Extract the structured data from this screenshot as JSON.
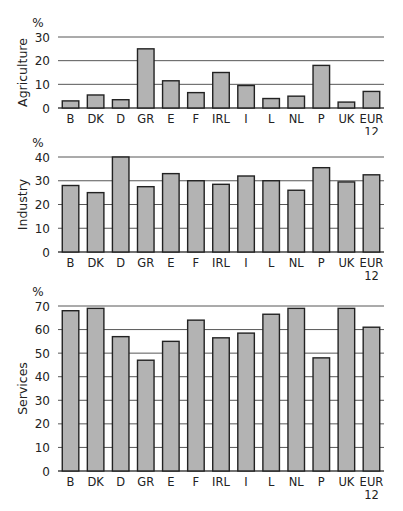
{
  "chart_data": [
    {
      "type": "bar",
      "title": "",
      "ylabel": "Agriculture",
      "unit": "%",
      "xlabel": "",
      "categories": [
        "B",
        "DK",
        "D",
        "GR",
        "E",
        "F",
        "IRL",
        "I",
        "L",
        "NL",
        "P",
        "UK",
        "EUR 12"
      ],
      "values": [
        3,
        5.5,
        3.5,
        25,
        11.5,
        6.5,
        15,
        9.5,
        4,
        5,
        18,
        2.5,
        7
      ],
      "ylim": [
        0,
        30
      ],
      "yticks": [
        0,
        10,
        20,
        30
      ],
      "grid": true,
      "legend": null
    },
    {
      "type": "bar",
      "title": "",
      "ylabel": "Industry",
      "unit": "%",
      "xlabel": "",
      "categories": [
        "B",
        "DK",
        "D",
        "GR",
        "E",
        "F",
        "IRL",
        "I",
        "L",
        "NL",
        "P",
        "UK",
        "EUR 12"
      ],
      "values": [
        28,
        25,
        40,
        27.5,
        33,
        30,
        28.5,
        32,
        30,
        26,
        35.5,
        29.5,
        32.5
      ],
      "ylim": [
        0,
        40
      ],
      "yticks": [
        0,
        10,
        20,
        30,
        40
      ],
      "grid": true,
      "legend": null
    },
    {
      "type": "bar",
      "title": "",
      "ylabel": "Services",
      "unit": "%",
      "xlabel": "",
      "categories": [
        "B",
        "DK",
        "D",
        "GR",
        "E",
        "F",
        "IRL",
        "I",
        "L",
        "NL",
        "P",
        "UK",
        "EUR 12"
      ],
      "values": [
        68,
        69,
        57,
        47,
        55,
        64,
        56.5,
        58.5,
        66.5,
        69,
        48,
        69,
        61
      ],
      "ylim": [
        0,
        70
      ],
      "yticks": [
        0,
        10,
        20,
        30,
        40,
        50,
        60,
        70
      ],
      "grid": true,
      "legend": null
    }
  ],
  "style": {
    "bar_fill": "#b3b3b3",
    "bar_stroke": "#222222",
    "grid_color": "#444444"
  }
}
